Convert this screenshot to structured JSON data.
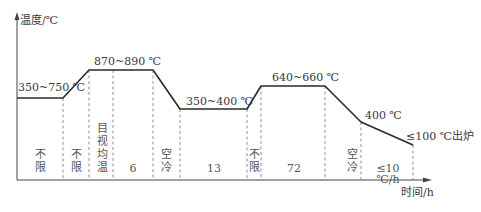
{
  "axes": {
    "y_label": "温度/℃",
    "x_label": "时间/h"
  },
  "temperature_labels": {
    "preheat": "350~750 ℃",
    "normalize": "870~890 ℃",
    "isothermal": "350~400 ℃",
    "temper": "640~660 ℃",
    "cool_point": "400 ℃",
    "discharge": "≤100 ℃出炉"
  },
  "segments": [
    {
      "id": "seg1",
      "label": "不限"
    },
    {
      "id": "seg2",
      "label": "不限"
    },
    {
      "id": "seg3",
      "label": "目视均温"
    },
    {
      "id": "seg4",
      "label": "6"
    },
    {
      "id": "seg5",
      "label": "空冷"
    },
    {
      "id": "seg6",
      "label": "13"
    },
    {
      "id": "seg7",
      "label": "不限"
    },
    {
      "id": "seg8",
      "label": "72"
    },
    {
      "id": "seg9",
      "label": "空冷"
    },
    {
      "id": "seg10",
      "label": "≤10 ℃/h"
    }
  ],
  "colors": {
    "curve": "#2a2a2a",
    "axis": "#444444",
    "dashed": "#777777",
    "text": "#3a3a3a"
  }
}
